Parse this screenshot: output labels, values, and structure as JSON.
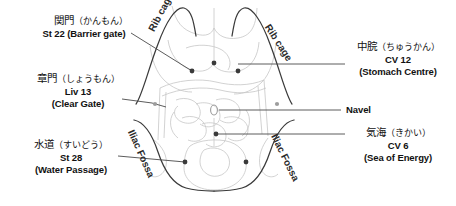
{
  "figure": {
    "background_color": "#ffffff",
    "outline_color": "#3a3a3a",
    "viscera_color": "#bdbdbd",
    "point_color": "#3a3a3a",
    "leader_color": "#4a4a4a"
  },
  "points": [
    {
      "id": "st22",
      "jp_kanji": "関門",
      "jp_kana": "（かんもん）",
      "code_and_name": "St 22 (Barrier gate)",
      "side": "left",
      "marker": {
        "x": 192,
        "y": 71
      }
    },
    {
      "id": "liv13",
      "jp_kanji": "章門",
      "jp_kana": "（しょうもん）",
      "code": "Liv 13",
      "name": "(Clear Gate)",
      "side": "left",
      "marker": {
        "x": 155,
        "y": 104
      }
    },
    {
      "id": "st28",
      "jp_kanji": "水道",
      "jp_kana": "（すいどう）",
      "code": "St 28",
      "name": "(Water Passage)",
      "side": "left",
      "marker": {
        "x": 185,
        "y": 162
      }
    },
    {
      "id": "cv12",
      "jp_kanji": "中脘",
      "jp_kana": "（ちゅうかん）",
      "code": "CV 12",
      "name": "(Stomach Centre)",
      "side": "right",
      "marker": {
        "x": 214,
        "y": 63
      }
    },
    {
      "id": "navel",
      "name": "Navel",
      "side": "right",
      "marker": {
        "x": 214,
        "y": 110
      }
    },
    {
      "id": "cv6",
      "jp_kanji": "気海",
      "jp_kana": "（きかい）",
      "code": "CV 6",
      "name": "(Sea of Energy)",
      "side": "right",
      "marker": {
        "x": 216,
        "y": 134
      }
    }
  ],
  "anatomy_labels": {
    "rib_cage_left": "Rib cage",
    "rib_cage_right": "Rib cage",
    "iliac_fossa_left": "Iliac Fossa",
    "iliac_fossa_right": "Iliac Fossa"
  },
  "extra_markers": [
    {
      "x": 238,
      "y": 71
    },
    {
      "x": 246,
      "y": 162
    },
    {
      "x": 168,
      "y": 104
    },
    {
      "x": 277,
      "y": 104
    }
  ]
}
